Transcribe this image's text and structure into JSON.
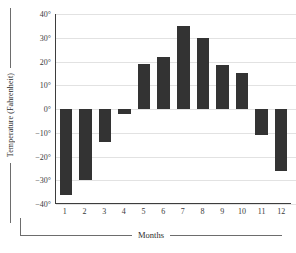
{
  "chart_data": {
    "type": "bar",
    "title": "",
    "xlabel": "Months",
    "ylabel": "Temperature (Fahrenheit)",
    "categories": [
      "1",
      "2",
      "3",
      "4",
      "5",
      "6",
      "7",
      "8",
      "9",
      "10",
      "11",
      "12"
    ],
    "values": [
      -36,
      -30,
      -14,
      -2,
      19,
      22,
      35,
      30,
      18.5,
      15,
      -11,
      -26
    ],
    "ylim": [
      -40,
      40
    ],
    "ytick_values": [
      40,
      30,
      20,
      10,
      0,
      -10,
      -20,
      -30,
      -40
    ],
    "ytick_labels": [
      "40°",
      "30°",
      "20°",
      "10°",
      "0°",
      "−10°",
      "−20°",
      "−30°",
      "−40°"
    ],
    "grid": true,
    "legend": null,
    "bar_color": "#333333",
    "grid_color": "#e2e2e2",
    "axis_color": "#3d3d3d"
  }
}
